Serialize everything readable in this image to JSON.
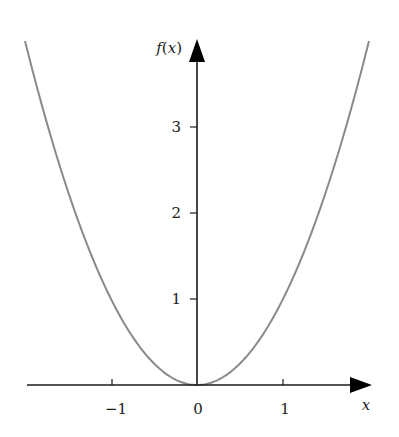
{
  "chart_data": {
    "type": "line",
    "title": "",
    "function": "f(x) = x^2",
    "xlabel": "x",
    "ylabel": "f(x)",
    "xlim": [
      -2,
      2
    ],
    "ylim": [
      0,
      4
    ],
    "grid": false,
    "legend": null,
    "x_ticks": [
      -1,
      0,
      1
    ],
    "x_tick_labels": [
      "−1",
      "0",
      "1"
    ],
    "y_ticks": [
      1,
      2,
      3
    ],
    "y_tick_labels": [
      "1",
      "2",
      "3"
    ],
    "series": [
      {
        "name": "f(x)",
        "color": "#8a8a8a",
        "x": [
          -2,
          -1.5,
          -1,
          -0.5,
          0,
          0.5,
          1,
          1.5,
          2
        ],
        "y": [
          4,
          2.25,
          1,
          0.25,
          0,
          0.25,
          1,
          2.25,
          4
        ]
      }
    ]
  },
  "axes": {
    "x_label": "x",
    "y_label_prefix": "f(",
    "y_label_var": "x",
    "y_label_suffix": ")",
    "x_tick_labels": [
      "−1",
      "0",
      "1"
    ],
    "y_tick_labels": [
      "1",
      "2",
      "3"
    ]
  },
  "colors": {
    "curve": "#8a8a8a",
    "axis": "#1a1a1a"
  }
}
